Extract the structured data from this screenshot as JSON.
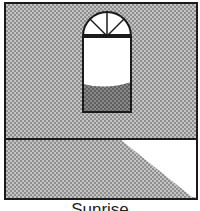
{
  "illustration": {
    "caption": "Sunrise",
    "colors": {
      "wall_light": "#bdbdbd",
      "wall_dark": "#8a8a8a",
      "outline": "#1a1a1a",
      "window_glass": "#ffffff",
      "window_lower": "#7a7a7a",
      "sunlight_patch": "#ffffff"
    },
    "elements": [
      "wall",
      "arched-window",
      "floor",
      "sunlight-patch"
    ]
  }
}
